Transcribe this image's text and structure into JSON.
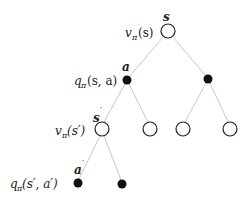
{
  "diagram": {
    "colors": {
      "edge": "#c8c8c8",
      "node_stroke": "#222222",
      "filled": "#111111"
    },
    "labels": {
      "root_state": "s",
      "root_value_func": "v",
      "root_value_sub": "π",
      "root_value_arg": "(s)",
      "action": "a",
      "action_value_func": "q",
      "action_value_sub": "π",
      "action_value_arg": "(s, a)",
      "next_state": "s",
      "next_state_prime": "′",
      "next_value_func": "v",
      "next_value_sub": "π",
      "next_value_arg": "(s′)",
      "next_action": "a",
      "next_action_prime": "′",
      "next_q_func": "q",
      "next_q_sub": "π",
      "next_q_arg": "(s′, a′)"
    },
    "nodes": [
      {
        "id": "root",
        "type": "state",
        "x": 168,
        "y": 31
      },
      {
        "id": "a1",
        "type": "action",
        "x": 127,
        "y": 80
      },
      {
        "id": "a2",
        "type": "action",
        "x": 208,
        "y": 79
      },
      {
        "id": "s1",
        "type": "state",
        "x": 102,
        "y": 129
      },
      {
        "id": "s2",
        "type": "state",
        "x": 150,
        "y": 129
      },
      {
        "id": "s3",
        "type": "state",
        "x": 183,
        "y": 129
      },
      {
        "id": "s4",
        "type": "state",
        "x": 230,
        "y": 129
      },
      {
        "id": "b1",
        "type": "action",
        "x": 78,
        "y": 183
      },
      {
        "id": "b2",
        "type": "action",
        "x": 122,
        "y": 184
      }
    ]
  }
}
